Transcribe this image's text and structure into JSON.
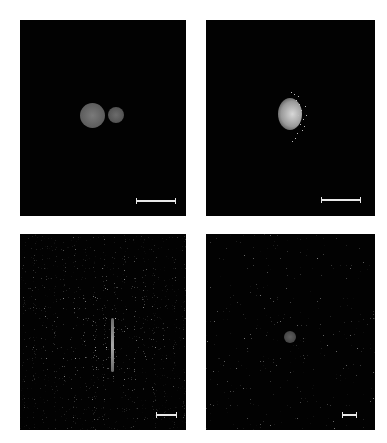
{
  "figure": {
    "layout": "2x2 grid of dark-field microscopy panels",
    "panels": [
      {
        "id": "top-left",
        "content": "two adjacent gray spheres (large and small)",
        "scale_bar": true
      },
      {
        "id": "top-right",
        "content": "single sphere with bright speckled right half",
        "scale_bar": true
      },
      {
        "id": "bottom-left",
        "content": "vertical bright streak amid diffuse speckle noise",
        "scale_bar": true
      },
      {
        "id": "bottom-right",
        "content": "small dim sphere amid sparse speckle noise",
        "scale_bar": true
      }
    ]
  },
  "colors": {
    "background": "#ffffff",
    "panel": "#020202",
    "scale_bar": "#e8e8e8",
    "sphere": "#6a6a6a"
  }
}
